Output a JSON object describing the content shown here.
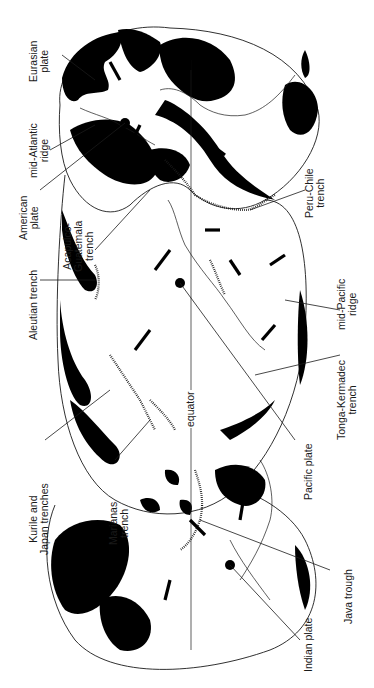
{
  "figure": {
    "type": "tectonic-plate-world-map",
    "orientation": "rotated 90 degrees counter-clockwise",
    "colors": {
      "land": "#000000",
      "ocean": "#ffffff",
      "lines": "#1a1a1a"
    }
  },
  "labels": {
    "eurasian_plate": {
      "line1": "Eurasian",
      "line2": "plate"
    },
    "mid_atlantic_ridge": {
      "line1": "mid-Atlantic",
      "line2": "ridge"
    },
    "american_plate": {
      "line1": "American",
      "line2": "plate"
    },
    "acapulco_guatemala_trench": {
      "line1": "Acapulco-",
      "line2": "Guatemala",
      "line3": "trench"
    },
    "aleutian_trench": {
      "line1": "Aleutian trench"
    },
    "kurile_japan_trenches": {
      "line1": "Kurile and",
      "line2": "Japan trenches"
    },
    "marianas_trench": {
      "line1": "Marianas",
      "line2": "trench"
    },
    "peru_chile_trench": {
      "line1": "Peru-Chile",
      "line2": "trench"
    },
    "mid_pacific_ridge": {
      "line1": "mid-Pacific",
      "line2": "ridge"
    },
    "tonga_kermadec_trench": {
      "line1": "Tonga-Kermadec",
      "line2": "trench"
    },
    "pacific_plate": {
      "line1": "Pacific plate"
    },
    "java_trough": {
      "line1": "Java trough"
    },
    "indian_plate": {
      "line1": "Indian plate"
    },
    "equator": {
      "line1": "equator"
    }
  }
}
